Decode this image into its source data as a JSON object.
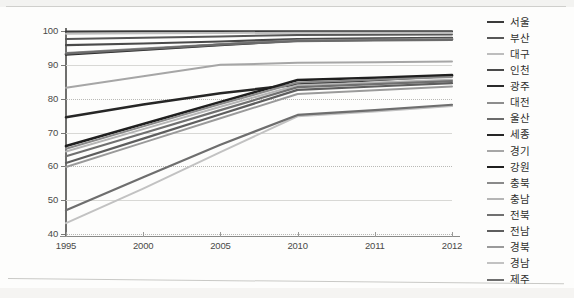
{
  "chart_data": {
    "type": "line",
    "title": "",
    "xlabel": "",
    "ylabel": "",
    "categories": [
      "1995",
      "2000",
      "2005",
      "2010",
      "2011",
      "2012"
    ],
    "x_tick_labels": [
      "1995",
      "2000",
      "2005",
      "2010",
      "2011",
      "2012"
    ],
    "y_tick_labels": [
      "100",
      "90",
      "80",
      "70",
      "60",
      "50",
      "40"
    ],
    "y_ticks": [
      100,
      90,
      80,
      70,
      60,
      50,
      40
    ],
    "ylim": [
      40,
      100
    ],
    "grid": "horizontal-dotted",
    "legend_position": "right",
    "series": [
      {
        "name": "서울",
        "color": "#3a3a3a",
        "width": 2.2,
        "values": [
          99.8,
          99.9,
          99.9,
          99.9,
          99.9,
          99.9
        ]
      },
      {
        "name": "부산",
        "color": "#575757",
        "width": 2.0,
        "values": [
          97.6,
          98.0,
          98.4,
          98.8,
          98.9,
          99.0
        ]
      },
      {
        "name": "대구",
        "color": "#bdbdbd",
        "width": 2.0,
        "values": [
          99.2,
          99.3,
          99.4,
          99.5,
          99.5,
          99.5
        ]
      },
      {
        "name": "인천",
        "color": "#4a4a4a",
        "width": 2.2,
        "values": [
          95.8,
          96.3,
          96.9,
          97.6,
          97.8,
          98.0
        ]
      },
      {
        "name": "광주",
        "color": "#2b2b2b",
        "width": 2.6,
        "values": [
          93.1,
          94.5,
          95.9,
          97.2,
          97.4,
          97.6
        ]
      },
      {
        "name": "대전",
        "color": "#8d8d8d",
        "width": 2.0,
        "values": [
          93.5,
          94.8,
          96.1,
          97.3,
          97.5,
          97.7
        ]
      },
      {
        "name": "울산",
        "color": "#6b6b6b",
        "width": 2.2,
        "values": [
          93.3,
          94.6,
          96.0,
          97.0,
          97.2,
          97.4
        ]
      },
      {
        "name": "세종",
        "color": "#262626",
        "width": 2.6,
        "values": [
          74.5,
          78.3,
          81.6,
          84.2,
          85.5,
          86.8
        ]
      },
      {
        "name": "경기",
        "color": "#a6a6a6",
        "width": 2.0,
        "values": [
          83.2,
          86.6,
          90.0,
          90.6,
          90.8,
          91.0
        ]
      },
      {
        "name": "강원",
        "color": "#1f1f1f",
        "width": 2.6,
        "values": [
          66.0,
          72.5,
          79.0,
          85.5,
          86.2,
          87.0
        ]
      },
      {
        "name": "충북",
        "color": "#8a8a8a",
        "width": 2.0,
        "values": [
          65.2,
          71.8,
          78.4,
          84.8,
          85.6,
          86.4
        ]
      },
      {
        "name": "충남",
        "color": "#b5b5b5",
        "width": 2.0,
        "values": [
          64.4,
          71.0,
          77.6,
          84.0,
          84.8,
          85.6
        ]
      },
      {
        "name": "전북",
        "color": "#707070",
        "width": 2.2,
        "values": [
          63.0,
          69.8,
          76.6,
          83.4,
          84.3,
          85.2
        ]
      },
      {
        "name": "전남",
        "color": "#5e5e5e",
        "width": 2.2,
        "values": [
          61.0,
          68.2,
          75.4,
          82.6,
          83.6,
          84.6
        ]
      },
      {
        "name": "경북",
        "color": "#9a9a9a",
        "width": 2.0,
        "values": [
          59.8,
          67.0,
          74.2,
          81.4,
          82.5,
          83.6
        ]
      },
      {
        "name": "경남",
        "color": "#c2c2c2",
        "width": 2.0,
        "values": [
          43.2,
          53.4,
          64.2,
          74.8,
          76.2,
          77.8
        ]
      },
      {
        "name": "제주",
        "color": "#6e6e6e",
        "width": 2.2,
        "values": [
          47.0,
          56.8,
          66.4,
          75.2,
          76.6,
          78.2
        ]
      }
    ]
  },
  "legend": {
    "items": [
      "서울",
      "부산",
      "대구",
      "인천",
      "광주",
      "대전",
      "울산",
      "세종",
      "경기",
      "강원",
      "충북",
      "충남",
      "전북",
      "전남",
      "경북",
      "경남",
      "제주"
    ]
  }
}
